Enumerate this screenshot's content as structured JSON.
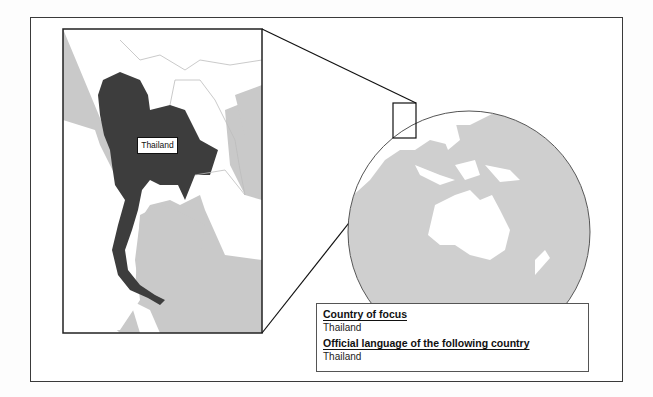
{
  "inset_map": {
    "country_label": "Thailand",
    "highlight_color": "#3d3d3d",
    "sea_color": "#c8c8c8",
    "land_color": "#ffffff"
  },
  "globe": {
    "sea_color": "#cfcfcf",
    "land_color": "#ffffff",
    "focus_region": "Southeast Asia"
  },
  "info_box": {
    "country_heading": "Country of focus",
    "country_value": "Thailand",
    "language_heading": "Official language of the following country",
    "language_value": "Thailand"
  }
}
